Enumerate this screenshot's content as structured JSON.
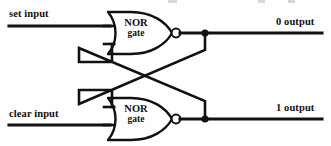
{
  "figure": {
    "background_color": "#ffffff",
    "line_color": "#111111",
    "width": 331,
    "height": 146
  },
  "labels": {
    "set_input": "set input",
    "clear_input": "clear input",
    "output_0": "0 output",
    "output_1": "1 output"
  },
  "gates": [
    {
      "id": "nor-top",
      "name_line1": "NOR",
      "name_line2": "gate",
      "type": "NOR",
      "inverting_bubble": true
    },
    {
      "id": "nor-bottom",
      "name_line1": "NOR",
      "name_line2": "gate",
      "type": "NOR",
      "inverting_bubble": true
    }
  ],
  "nets": [
    {
      "name": "set-input-wire",
      "from": "set input",
      "to": "nor-top input A"
    },
    {
      "name": "clear-input-wire",
      "from": "clear input",
      "to": "nor-bottom input B"
    },
    {
      "name": "output-0-wire",
      "from": "nor-top output",
      "to": "0 output"
    },
    {
      "name": "output-1-wire",
      "from": "nor-bottom output",
      "to": "1 output"
    },
    {
      "name": "feedback-top-to-bottom",
      "from": "nor-top output tap",
      "to": "nor-bottom input A"
    },
    {
      "name": "feedback-bottom-to-top",
      "from": "nor-bottom output tap",
      "to": "nor-top input B"
    }
  ],
  "junctions": [
    {
      "name": "tap-0-output",
      "x": 205,
      "y": 32
    },
    {
      "name": "tap-1-output",
      "x": 205,
      "y": 118
    }
  ]
}
